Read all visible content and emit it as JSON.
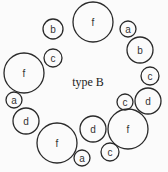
{
  "diagram": {
    "title": "type B",
    "circles": [
      {
        "label": "b",
        "cx": 53,
        "cy": 29,
        "r": 10
      },
      {
        "label": "f",
        "cx": 93,
        "cy": 22,
        "r": 20
      },
      {
        "label": "a",
        "cx": 128,
        "cy": 29,
        "r": 8
      },
      {
        "label": "b",
        "cx": 140,
        "cy": 50,
        "r": 13
      },
      {
        "label": "c",
        "cx": 150,
        "cy": 76,
        "r": 9
      },
      {
        "label": "c",
        "cx": 53,
        "cy": 58,
        "r": 9
      },
      {
        "label": "f",
        "cx": 24,
        "cy": 73,
        "r": 20
      },
      {
        "label": "a",
        "cx": 14,
        "cy": 100,
        "r": 8
      },
      {
        "label": "d",
        "cx": 26,
        "cy": 121,
        "r": 13
      },
      {
        "label": "f",
        "cx": 57,
        "cy": 143,
        "r": 20
      },
      {
        "label": "d",
        "cx": 93,
        "cy": 129,
        "r": 13
      },
      {
        "label": "a",
        "cx": 82,
        "cy": 158,
        "r": 8
      },
      {
        "label": "c",
        "cx": 110,
        "cy": 152,
        "r": 9
      },
      {
        "label": "f",
        "cx": 128,
        "cy": 129,
        "r": 20
      },
      {
        "label": "c",
        "cx": 125,
        "cy": 102,
        "r": 8
      },
      {
        "label": "d",
        "cx": 148,
        "cy": 101,
        "r": 13
      }
    ]
  }
}
